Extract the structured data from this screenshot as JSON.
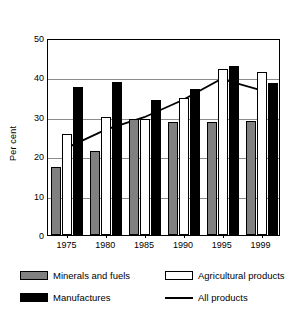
{
  "chart_data": {
    "type": "bar",
    "title": "",
    "subtitle": "",
    "xlabel": "",
    "ylabel": "Per cent",
    "categories": [
      "1975",
      "1980",
      "1985",
      "1990",
      "1995",
      "1999"
    ],
    "ylim": [
      0,
      50
    ],
    "yticks": [
      0,
      10,
      20,
      30,
      40,
      50
    ],
    "ytick_labels": [
      "0",
      "10",
      "20",
      "30",
      "40",
      "50"
    ],
    "grid": true,
    "grid_axis": "y",
    "legend_position": "bottom",
    "series": [
      {
        "name": "Minerals and fuels",
        "kind": "bar",
        "color": "#808080",
        "values": [
          17.3,
          21.4,
          29.4,
          28.7,
          28.7,
          29.0
        ]
      },
      {
        "name": "Agricultural products",
        "kind": "bar",
        "color": "#ffffff",
        "values": [
          25.6,
          30.0,
          29.4,
          34.9,
          42.2,
          41.5
        ]
      },
      {
        "name": "Manufactures",
        "kind": "bar",
        "color": "#000000",
        "values": [
          37.5,
          38.9,
          34.3,
          37.0,
          42.8,
          38.6
        ]
      },
      {
        "name": "All products",
        "kind": "line",
        "color": "#000000",
        "values": [
          22.4,
          27.0,
          30.2,
          34.6,
          40.0,
          37.2
        ]
      }
    ]
  },
  "axis": {
    "y_title": "Per cent"
  },
  "legend": {
    "entries": [
      {
        "label": "Minerals and fuels",
        "swatch": "minerals"
      },
      {
        "label": "Agricultural products",
        "swatch": "agricultural"
      },
      {
        "label": "Manufactures",
        "swatch": "manufactures"
      },
      {
        "label": "All products",
        "swatch": "line"
      }
    ]
  }
}
